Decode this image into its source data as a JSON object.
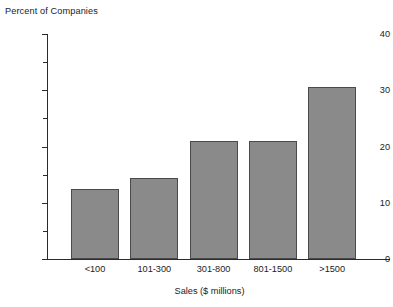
{
  "chart_data": {
    "type": "bar",
    "title": "Percent of Companies",
    "xlabel": "Sales ($ millions)",
    "ylabel": "Percent of Companies",
    "categories": [
      "<100",
      "101-300",
      "301-800",
      "801-1500",
      ">1500"
    ],
    "values": [
      12.5,
      14.4,
      21.0,
      21.0,
      30.6
    ],
    "ylim": [
      0,
      40
    ],
    "ytick_labels": [
      "0",
      "10",
      "20",
      "30",
      "40"
    ],
    "ytick_values": [
      0,
      10,
      20,
      30,
      40
    ],
    "yminor_tick_values": [
      5,
      15,
      25,
      35
    ],
    "grid": false,
    "legend": null,
    "bar_color": "#8a8a8a",
    "bar_edge_color": "#4a4a4a",
    "axis_color": "#2b2b2b",
    "background": "#ffffff"
  },
  "axis": {
    "y_labels": [
      {
        "text": "40",
        "value": 40
      },
      {
        "text": "30",
        "value": 30
      },
      {
        "text": "20",
        "value": 20
      },
      {
        "text": "10",
        "value": 10
      },
      {
        "text": "0",
        "value": 0
      }
    ],
    "x_labels": [
      {
        "text": "<100"
      },
      {
        "text": "101-300"
      },
      {
        "text": "301-800"
      },
      {
        "text": "801-1500"
      },
      {
        "text": ">1500"
      }
    ],
    "x_title": "Sales ($ millions)",
    "y_title": "Percent of Companies"
  }
}
